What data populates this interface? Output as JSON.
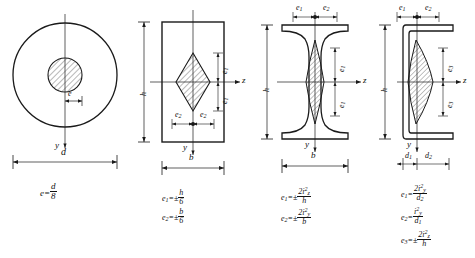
{
  "figure": {
    "line_color": "#1a1a1a",
    "hatch_color": "#333333",
    "background": "#ffffff"
  },
  "panels": [
    {
      "id": "circle-section",
      "section_type": "solid circular section",
      "axis_labels": {
        "vertical": "y",
        "horizontal": ""
      },
      "dimension_labels": [
        {
          "name": "diameter",
          "text": "d"
        },
        {
          "name": "eccentricity",
          "text": "e"
        }
      ],
      "kern_shape": "circle",
      "formulas": [
        {
          "lhs": "e",
          "relation": "=",
          "num": "d",
          "den": "8"
        }
      ]
    },
    {
      "id": "rectangle-section",
      "section_type": "solid rectangular section",
      "axis_labels": {
        "vertical": "y",
        "horizontal": "z"
      },
      "dimension_labels": [
        {
          "name": "height",
          "text": "h"
        },
        {
          "name": "width",
          "text": "b"
        },
        {
          "name": "ecc-vertical",
          "text": "e",
          "sub": "1"
        },
        {
          "name": "ecc-horizontal",
          "text": "e",
          "sub": "2"
        }
      ],
      "kern_shape": "rhombus",
      "formulas": [
        {
          "lhs": "e",
          "lhs_sub": "1",
          "relation": "=±",
          "num": "h",
          "den": "6"
        },
        {
          "lhs": "e",
          "lhs_sub": "2",
          "relation": "=±",
          "num": "b",
          "den": "6"
        }
      ]
    },
    {
      "id": "i-beam-section",
      "section_type": "rolled I-beam section",
      "axis_labels": {
        "vertical": "y",
        "horizontal": "z"
      },
      "dimension_labels": [
        {
          "name": "height",
          "text": "h"
        },
        {
          "name": "width",
          "text": "b"
        },
        {
          "name": "ecc-vertical",
          "text": "e",
          "sub": "1"
        },
        {
          "name": "ecc-horizontal",
          "text": "e",
          "sub": "2"
        }
      ],
      "kern_shape": "concave-lens",
      "formulas": [
        {
          "lhs": "e",
          "lhs_sub": "1",
          "relation": "=±",
          "num": "2i",
          "num_sup": "2",
          "num_sub": "z",
          "den": "h"
        },
        {
          "lhs": "e",
          "lhs_sub": "2",
          "relation": "=±",
          "num": "2i",
          "num_sup": "2",
          "num_sub": "y",
          "den": "b"
        }
      ]
    },
    {
      "id": "channel-section",
      "section_type": "rolled channel section",
      "axis_labels": {
        "vertical": "y",
        "horizontal": "z"
      },
      "dimension_labels": [
        {
          "name": "height",
          "text": "h"
        },
        {
          "name": "dist-to-left",
          "text": "d",
          "sub": "1"
        },
        {
          "name": "dist-to-right",
          "text": "d",
          "sub": "2"
        },
        {
          "name": "ecc-top-left",
          "text": "e",
          "sub": "1"
        },
        {
          "name": "ecc-top-right",
          "text": "e",
          "sub": "2"
        },
        {
          "name": "ecc-vertical-upper",
          "text": "e",
          "sub": "3"
        },
        {
          "name": "ecc-vertical-lower",
          "text": "e",
          "sub": "3"
        }
      ],
      "kern_shape": "asymmetric-lens",
      "formulas": [
        {
          "lhs": "e",
          "lhs_sub": "1",
          "relation": "=",
          "num": "2i",
          "num_sup": "2",
          "num_sub": "y",
          "den": "d",
          "den_sub": "2"
        },
        {
          "lhs": "e",
          "lhs_sub": "2",
          "relation": "=",
          "num": "i",
          "num_sup": "2",
          "num_sub": "y",
          "den": "d",
          "den_sub": "1"
        },
        {
          "lhs": "e",
          "lhs_sub": "3",
          "relation": "=±",
          "num": "2i",
          "num_sup": "2",
          "num_sub": "z",
          "den": "h"
        }
      ]
    }
  ]
}
